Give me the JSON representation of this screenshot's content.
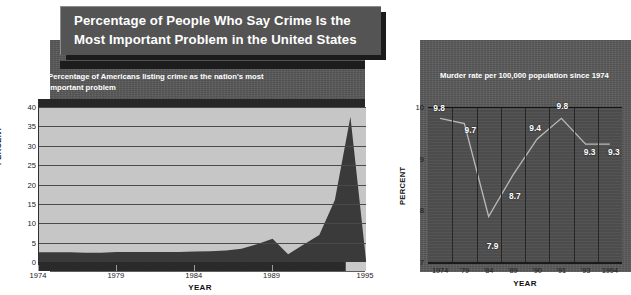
{
  "title": "Percentage of People Who Say Crime Is the Most Important Problem in the United States",
  "left_chart": {
    "subtitle": "Percentage of Americans listing crime as the nation's most important problem",
    "xlabel": "YEAR",
    "ylabel": "PERCENT"
  },
  "right_chart": {
    "subtitle": "Murder rate per 100,000 population since 1974",
    "xlabel": "YEAR",
    "ylabel": "PERCENT"
  },
  "footnote": "",
  "colors": {
    "title_plaque": "#545454",
    "backdrop": "#585858",
    "left_plot_bg": "#c6c6c6",
    "left_area_fill": "#3a3a3a",
    "right_plot_bg": "#4f4f4f",
    "right_line": "#b9b9b9",
    "label_text": "#ffffff"
  },
  "chart_data": [
    {
      "type": "area",
      "title": "Percentage of Americans listing crime as the nation's most important problem",
      "xlabel": "YEAR",
      "ylabel": "PERCENT",
      "ylim": [
        0,
        40
      ],
      "yticks": [
        0,
        5,
        10,
        15,
        20,
        25,
        30,
        35,
        40
      ],
      "xlim": [
        1974,
        1995
      ],
      "xticks": [
        1974,
        1979,
        1984,
        1989,
        1995
      ],
      "xtick_labels": [
        "1974",
        "1979",
        "1984",
        "1989",
        "1995"
      ],
      "grid": true,
      "x": [
        1974,
        1975,
        1976,
        1977,
        1978,
        1979,
        1980,
        1981,
        1982,
        1983,
        1984,
        1985,
        1986,
        1987,
        1988,
        1989,
        1990,
        1991,
        1992,
        1993,
        1994,
        1995
      ],
      "values": [
        2.5,
        2.5,
        2.5,
        2.4,
        2.4,
        2.6,
        2.6,
        2.6,
        2.6,
        2.6,
        2.7,
        2.8,
        3.0,
        3.4,
        4.6,
        6.0,
        2.0,
        4.5,
        7.0,
        16.0,
        37.5,
        0.5
      ]
    },
    {
      "type": "line",
      "title": "Murder rate per 100,000 population since 1974",
      "xlabel": "YEAR",
      "ylabel": "PERCENT",
      "ylim": [
        7,
        10
      ],
      "yticks": [
        7,
        8,
        9,
        10
      ],
      "grid": true,
      "grid_orientation": "vertical",
      "categories": [
        "1974",
        "'79",
        "'84",
        "'89",
        "'90",
        "'91",
        "'93",
        "1994"
      ],
      "values": [
        9.8,
        9.7,
        7.9,
        8.7,
        9.4,
        9.8,
        9.3,
        9.3
      ],
      "data_labels": [
        "9.8",
        "9.7",
        "7.9",
        "8.7",
        "9.4",
        "9.8",
        "9.3",
        "9.3"
      ]
    }
  ]
}
